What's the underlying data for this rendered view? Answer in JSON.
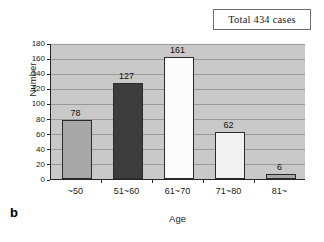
{
  "panel": {
    "letter": "b"
  },
  "annotation": {
    "total_box_label": "Total 434 cases"
  },
  "colors": {
    "plot_background": "#c9c9c9",
    "gridline": "#9a9a9a",
    "axis": "#262626",
    "bar_outline": "#2b2b2b",
    "bar_medium_gray": "#a8a8a8",
    "bar_dark_gray": "#3d3d3d",
    "bar_white": "#fbfbfb",
    "bar_light": "#f2f2f2",
    "text": "#1a1a1a"
  },
  "chart_data": {
    "type": "bar",
    "title": "",
    "subtitle": "",
    "xlabel": "Age",
    "ylabel": "Number",
    "categories": [
      "~50",
      "51~60",
      "61~70",
      "71~80",
      "81~"
    ],
    "values": [
      78,
      127,
      161,
      62,
      6
    ],
    "bar_colors": [
      "#a8a8a8",
      "#3d3d3d",
      "#fbfbfb",
      "#f2f2f2",
      "#a8a8a8"
    ],
    "data_labels": [
      "78",
      "127",
      "161",
      "62",
      "6"
    ],
    "ylim": [
      0,
      180
    ],
    "ytick_step": 20,
    "yticks": [
      0,
      20,
      40,
      60,
      80,
      100,
      120,
      140,
      160,
      180
    ],
    "ytick_labels": [
      "0",
      "20",
      "40",
      "60",
      "80",
      "100",
      "120",
      "140",
      "160",
      "180"
    ],
    "grid": "horizontal",
    "legend_position": "none",
    "annotation": "Total 434 cases",
    "total": 434
  }
}
